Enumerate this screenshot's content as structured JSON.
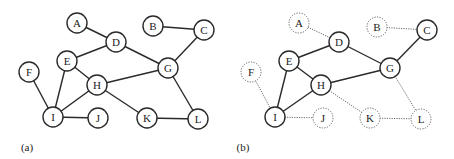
{
  "figure": {
    "panels": [
      {
        "id": "a",
        "label": "(a)",
        "label_pos": [
          27,
          147
        ],
        "nodes": [
          {
            "id": "A",
            "x": 77,
            "y": 23,
            "style": "solid"
          },
          {
            "id": "B",
            "x": 153,
            "y": 26,
            "style": "solid"
          },
          {
            "id": "C",
            "x": 204,
            "y": 30,
            "style": "solid"
          },
          {
            "id": "D",
            "x": 116,
            "y": 42,
            "style": "solid"
          },
          {
            "id": "E",
            "x": 67,
            "y": 61,
            "style": "solid"
          },
          {
            "id": "F",
            "x": 29,
            "y": 72,
            "style": "solid"
          },
          {
            "id": "G",
            "x": 168,
            "y": 68,
            "style": "solid"
          },
          {
            "id": "H",
            "x": 97,
            "y": 85,
            "style": "solid"
          },
          {
            "id": "I",
            "x": 53,
            "y": 117,
            "style": "solid"
          },
          {
            "id": "J",
            "x": 98,
            "y": 118,
            "style": "solid"
          },
          {
            "id": "K",
            "x": 147,
            "y": 118,
            "style": "solid"
          },
          {
            "id": "L",
            "x": 198,
            "y": 119,
            "style": "solid"
          }
        ],
        "edges": [
          {
            "from": "A",
            "to": "D",
            "style": "solid"
          },
          {
            "from": "B",
            "to": "C",
            "style": "solid"
          },
          {
            "from": "C",
            "to": "G",
            "style": "solid"
          },
          {
            "from": "D",
            "to": "E",
            "style": "solid"
          },
          {
            "from": "D",
            "to": "G",
            "style": "solid"
          },
          {
            "from": "E",
            "to": "H",
            "style": "solid"
          },
          {
            "from": "E",
            "to": "I",
            "style": "solid"
          },
          {
            "from": "F",
            "to": "I",
            "style": "solid"
          },
          {
            "from": "H",
            "to": "I",
            "style": "solid"
          },
          {
            "from": "H",
            "to": "G",
            "style": "solid"
          },
          {
            "from": "H",
            "to": "K",
            "style": "solid"
          },
          {
            "from": "I",
            "to": "J",
            "style": "solid"
          },
          {
            "from": "K",
            "to": "L",
            "style": "solid"
          },
          {
            "from": "G",
            "to": "L",
            "style": "solid"
          }
        ]
      },
      {
        "id": "b",
        "label": "(b)",
        "label_pos": [
          243,
          147
        ],
        "nodes": [
          {
            "id": "A",
            "x": 299,
            "y": 23,
            "style": "dashed"
          },
          {
            "id": "B",
            "x": 377,
            "y": 27,
            "style": "dashed"
          },
          {
            "id": "C",
            "x": 427,
            "y": 30,
            "style": "solid"
          },
          {
            "id": "D",
            "x": 339,
            "y": 42,
            "style": "solid"
          },
          {
            "id": "E",
            "x": 289,
            "y": 61,
            "style": "solid"
          },
          {
            "id": "F",
            "x": 251,
            "y": 72,
            "style": "dashed"
          },
          {
            "id": "G",
            "x": 390,
            "y": 68,
            "style": "solid"
          },
          {
            "id": "H",
            "x": 321,
            "y": 85,
            "style": "solid"
          },
          {
            "id": "I",
            "x": 275,
            "y": 117,
            "style": "solid"
          },
          {
            "id": "J",
            "x": 323,
            "y": 118,
            "style": "dashed"
          },
          {
            "id": "K",
            "x": 370,
            "y": 118,
            "style": "dashed"
          },
          {
            "id": "L",
            "x": 421,
            "y": 119,
            "style": "dashed"
          }
        ],
        "edges": [
          {
            "from": "A",
            "to": "D",
            "style": "dotted"
          },
          {
            "from": "B",
            "to": "C",
            "style": "dotted"
          },
          {
            "from": "C",
            "to": "G",
            "style": "solid"
          },
          {
            "from": "D",
            "to": "E",
            "style": "solid"
          },
          {
            "from": "D",
            "to": "G",
            "style": "solid"
          },
          {
            "from": "E",
            "to": "H",
            "style": "solid"
          },
          {
            "from": "E",
            "to": "I",
            "style": "solid"
          },
          {
            "from": "F",
            "to": "I",
            "style": "dotted"
          },
          {
            "from": "H",
            "to": "I",
            "style": "solid"
          },
          {
            "from": "H",
            "to": "G",
            "style": "solid"
          },
          {
            "from": "H",
            "to": "K",
            "style": "dotted"
          },
          {
            "from": "I",
            "to": "J",
            "style": "dotted"
          },
          {
            "from": "K",
            "to": "L",
            "style": "dotted"
          },
          {
            "from": "G",
            "to": "L",
            "style": "dotted"
          }
        ]
      }
    ],
    "node_radius": 10,
    "colors": {
      "stroke": "#2a2a2a",
      "dotted_stroke": "#6a6a6a",
      "node_fill": "#ffffff",
      "text": "#222222"
    }
  }
}
